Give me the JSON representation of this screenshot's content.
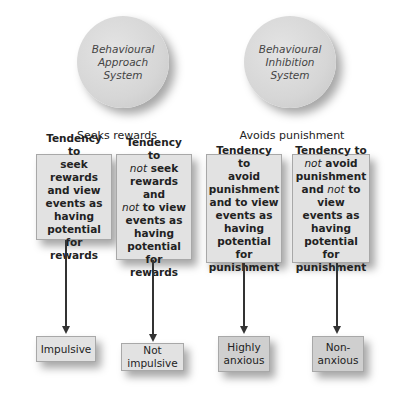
{
  "systems": [
    {
      "name": "Behavioural\nApproach\nSystem",
      "tendency_label": "Seeks rewards"
    },
    {
      "name": "Behavioural\nInhibition\nSystem",
      "tendency_label": "Avoids punishment"
    }
  ],
  "tendencies": [
    {
      "lines": [
        "Tendency to",
        "seek rewards",
        "and view",
        "events as",
        "having",
        "potential for",
        "rewards"
      ]
    },
    {
      "lines": [
        "Tendency to",
        "not seek",
        "rewards and",
        "not to view",
        "events as",
        "having",
        "potential for",
        "rewards"
      ]
    },
    {
      "lines": [
        "Tendency to",
        "avoid",
        "punishment",
        "and to view",
        "events as",
        "having",
        "potential for",
        "punishment"
      ]
    },
    {
      "lines": [
        "Tendency to",
        "not avoid",
        "punishment",
        "and not to view",
        "events as",
        "having",
        "potential for",
        "punishment"
      ]
    }
  ],
  "outcomes": [
    {
      "label": "Impulsive"
    },
    {
      "label": "Not\nimpulsive"
    },
    {
      "label": "Highly\nanxious"
    },
    {
      "label": "Non-\nanxious"
    }
  ]
}
